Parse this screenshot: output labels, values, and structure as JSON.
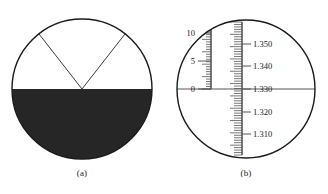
{
  "figure": {
    "panels": [
      {
        "id": "a",
        "caption": "(a)",
        "description": "refractometer-field-shadow-line",
        "circle": {
          "cx": 82,
          "cy": 89,
          "r": 70
        },
        "boundary": {
          "type": "horizontal-shadow-line",
          "y": 89,
          "upper_field_color": "#ffffff",
          "lower_field_color": "#262626"
        },
        "crosshair": {
          "type": "v-shaped-reticle",
          "apex_x": 82,
          "apex_y": 89,
          "left_arm_end_x": 39,
          "left_arm_end_y": 34,
          "right_arm_end_x": 125,
          "right_arm_end_y": 34,
          "color": "#3a3a3a"
        }
      },
      {
        "id": "b",
        "caption": "(b)",
        "description": "refractometer-dual-scale-reading",
        "circle": {
          "cx": 82,
          "cy": 89,
          "r": 69
        },
        "boundary": {
          "type": "horizontal-shadow-line",
          "y": 89,
          "color": "#555555"
        },
        "left_scale": {
          "name": "brix-percent-scale",
          "labels": [
            "10",
            "5",
            "0"
          ],
          "label_y": [
            33,
            61,
            89
          ],
          "tick_x": 47,
          "tick_length_major": 9,
          "tick_length_minor": 5,
          "top_y": 27,
          "bottom_y": 89,
          "minor_ticks": 25,
          "color": "#555555"
        },
        "right_scale": {
          "name": "refractive-index-scale",
          "labels": [
            "1.350",
            "1.340",
            "1.330",
            "1.320",
            "1.310"
          ],
          "label_y": [
            44,
            66,
            89,
            112,
            134
          ],
          "tick_x": 78,
          "tick_length_major": 8,
          "tick_length_minor": 4,
          "top_y": 22,
          "bottom_y": 155,
          "minor_ticks": 54,
          "color": "#555555"
        }
      }
    ]
  },
  "chart_data": {
    "type": "diagram",
    "panels": [
      {
        "label": "(a)",
        "type": "shadow-line-with-crosshair",
        "shadow_boundary_fraction": 0.5,
        "note": "Dark lower field, bright upper field, V reticle converging on boundary"
      },
      {
        "label": "(b)",
        "type": "dual-scale",
        "series": [
          {
            "name": "Brix (%)",
            "tick_labels": [
              "0",
              "5",
              "10"
            ],
            "range": [
              0,
              10
            ],
            "position": "left"
          },
          {
            "name": "Refractive index (nD)",
            "tick_labels": [
              "1.310",
              "1.320",
              "1.330",
              "1.340",
              "1.350"
            ],
            "range": [
              1.305,
              1.355
            ],
            "position": "right"
          }
        ],
        "reading_line": {
          "brix": 0,
          "refractive_index": "1.330"
        }
      }
    ],
    "xlabel": "",
    "ylabel": "",
    "grid": false,
    "legend": "none"
  }
}
